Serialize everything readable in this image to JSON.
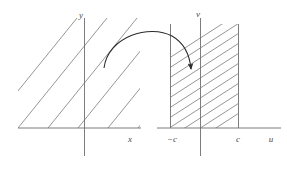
{
  "figure": {
    "background_color": "#ffffff",
    "line_color": "#8a8a8a",
    "axis_color": "#6e6e6e",
    "arrow_color": "#2b2b2b",
    "label_color": "#4a4a4a"
  },
  "left_panel": {
    "name": "xy-plane",
    "axes": {
      "vertical_label": "y",
      "horizontal_label": "x"
    },
    "hatching": {
      "direction": "up-right",
      "angle_degrees": 52,
      "count": 6
    }
  },
  "right_panel": {
    "name": "uv-plane",
    "axes": {
      "vertical_label": "v",
      "horizontal_label": "u"
    },
    "ticks": [
      {
        "label": "−c",
        "position": "left-boundary"
      },
      {
        "label": "c",
        "position": "right-boundary"
      }
    ],
    "region": {
      "description": "vertical strip between -c and c",
      "hatching": {
        "direction": "up-right",
        "angle_degrees": 33,
        "count": 11
      }
    }
  },
  "mapping_arrow": {
    "name": "mapping-arrow",
    "style": "curved",
    "direction": "left-to-right",
    "head": "filled-triangle"
  }
}
